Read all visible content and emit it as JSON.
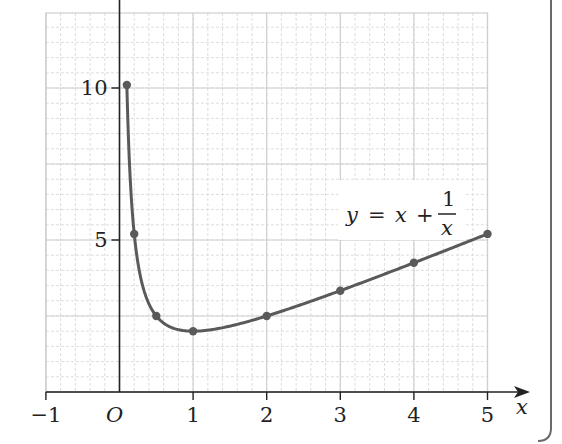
{
  "colors": {
    "axis": "#222222",
    "curve": "#5a5a5a",
    "point": "#5a5a5a",
    "grid_major": "#cfcfcf",
    "grid_minor": "#dddddd",
    "panel_border": "#6a6a6a"
  },
  "chart_data": {
    "type": "line",
    "title": "",
    "xlabel": "x",
    "ylabel": "",
    "origin_label": "O",
    "xlim": [
      -1,
      5
    ],
    "ylim": [
      0,
      12.5
    ],
    "x_ticks": [
      -1,
      1,
      2,
      3,
      4,
      5
    ],
    "x_tick_labels": [
      "−1",
      "1",
      "2",
      "3",
      "4",
      "5"
    ],
    "y_ticks": [
      5,
      10
    ],
    "y_tick_labels": [
      "5",
      "10"
    ],
    "grid": true,
    "grid_major_x_step": 1,
    "grid_minor_x_step": 0.2,
    "grid_major_y_step": 2.5,
    "grid_minor_y_step": 0.5,
    "annotation": {
      "lhs": "y",
      "eq": "=",
      "x": "x",
      "plus": "+",
      "numerator": "1",
      "denominator": "x",
      "text": "y = x + 1/x"
    },
    "series": [
      {
        "name": "y = x + 1/x",
        "points": [
          {
            "x": 0.1,
            "y": 10.1
          },
          {
            "x": 0.2,
            "y": 5.2
          },
          {
            "x": 0.5,
            "y": 2.5
          },
          {
            "x": 1,
            "y": 2
          },
          {
            "x": 2,
            "y": 2.5
          },
          {
            "x": 3,
            "y": 3.33
          },
          {
            "x": 4,
            "y": 4.25
          },
          {
            "x": 5,
            "y": 5.2
          }
        ]
      }
    ]
  }
}
